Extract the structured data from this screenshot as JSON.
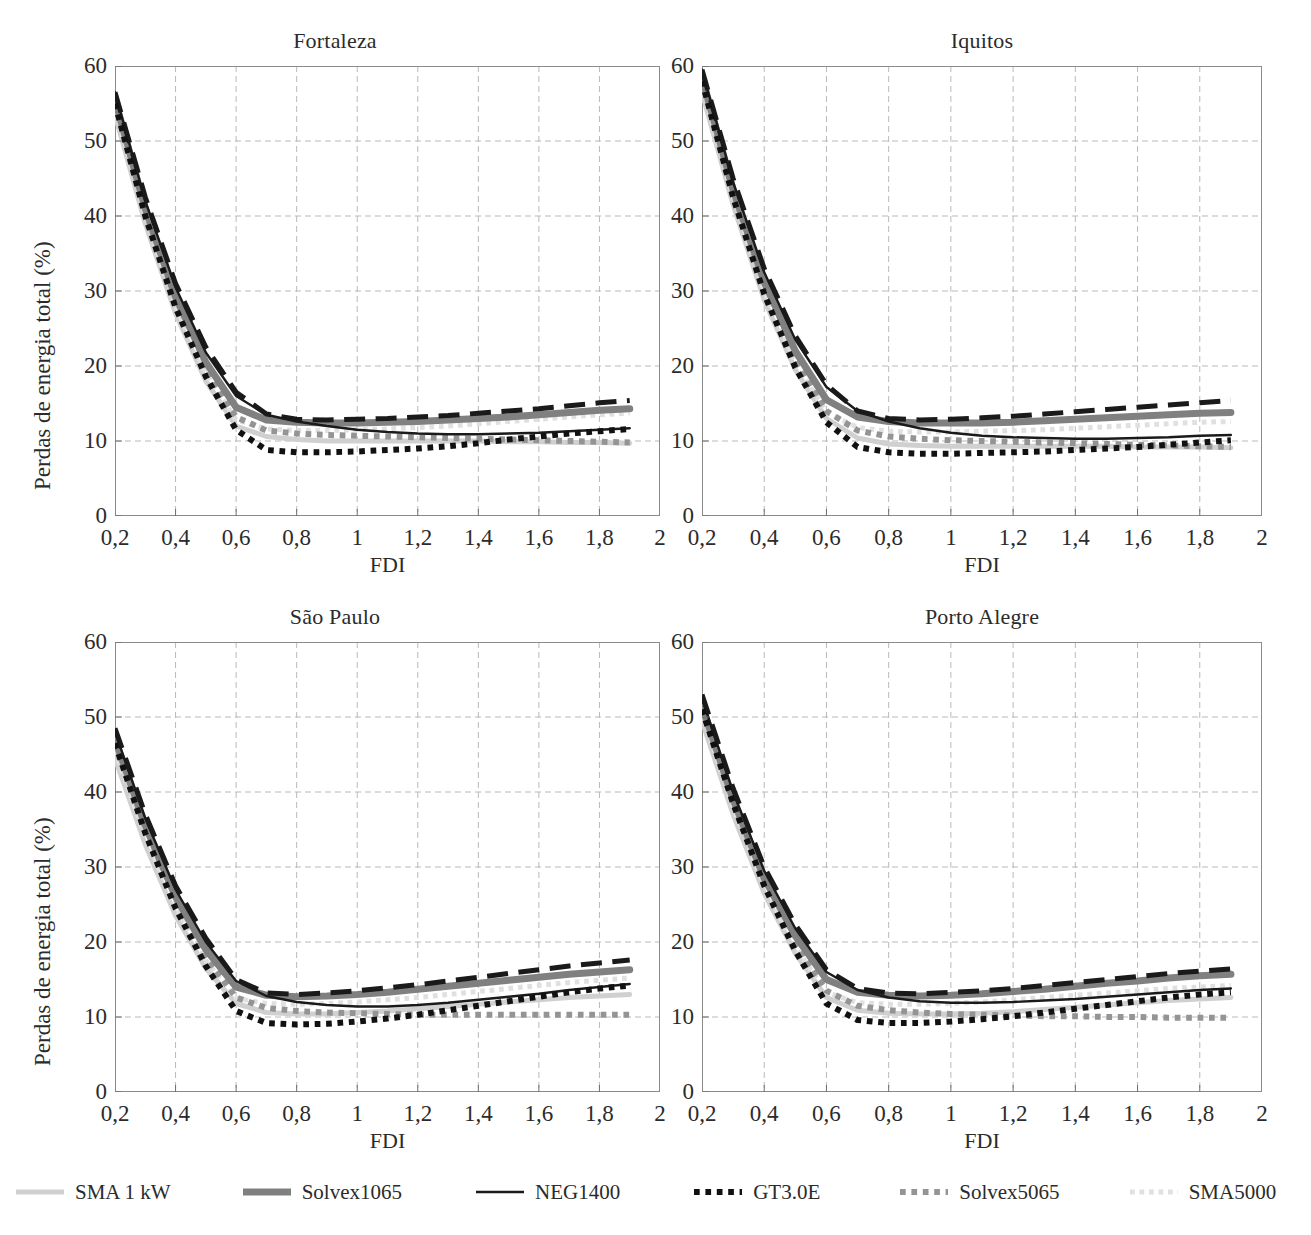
{
  "figure": {
    "ylabel": "Perdas de energia total (%)",
    "xlabel": "FDI",
    "yticks": [
      "0",
      "10",
      "20",
      "30",
      "40",
      "50",
      "60"
    ],
    "xticks": [
      "0,2",
      "0,4",
      "0,6",
      "0,8",
      "1",
      "1,2",
      "1,4",
      "1,6",
      "1,8",
      "2"
    ]
  },
  "legend": {
    "items": [
      {
        "label": "SMA 1 kW",
        "color": "#d0d0d0",
        "width": 5,
        "dash": "none"
      },
      {
        "label": "Solvex1065",
        "color": "#808080",
        "width": 7,
        "dash": "none"
      },
      {
        "label": "NEG1400",
        "color": "#1a1a1a",
        "width": 2.4,
        "dash": "none"
      },
      {
        "label": "GT3.0E",
        "color": "#111111",
        "width": 6,
        "dash": "dot"
      },
      {
        "label": "Solvex5065",
        "color": "#949494",
        "width": 6,
        "dash": "dot"
      },
      {
        "label": "SMA5000",
        "color": "#e0e0e0",
        "width": 5,
        "dash": "dot"
      },
      {
        "label": "PVV3000",
        "color": "#1a1a1a",
        "width": 5,
        "dash": "dash"
      }
    ]
  },
  "chart_data": [
    {
      "type": "line",
      "title": "Fortaleza",
      "xlabel": "FDI",
      "ylabel": "Perdas de energia total (%)",
      "xlim": [
        0.2,
        2.0
      ],
      "ylim": [
        0,
        60
      ],
      "grid": true,
      "legend_position": "bottom",
      "x": [
        0.2,
        0.3,
        0.4,
        0.5,
        0.6,
        0.7,
        0.8,
        0.9,
        1.0,
        1.1,
        1.2,
        1.3,
        1.4,
        1.5,
        1.6,
        1.7,
        1.8,
        1.9
      ],
      "series": [
        {
          "name": "SMA 1 kW",
          "values": [
            53.5,
            39.0,
            27.0,
            18.0,
            12.0,
            10.6,
            10.2,
            10.0,
            10.0,
            10.0,
            10.0,
            10.0,
            10.0,
            9.9,
            9.9,
            9.8,
            9.8,
            9.7
          ]
        },
        {
          "name": "Solvex1065",
          "values": [
            55.5,
            41.0,
            29.2,
            20.5,
            14.5,
            12.8,
            12.5,
            12.4,
            12.4,
            12.5,
            12.6,
            12.8,
            13.0,
            13.2,
            13.5,
            13.8,
            14.1,
            14.3
          ]
        },
        {
          "name": "NEG1400",
          "values": [
            56.5,
            42.0,
            30.5,
            21.8,
            16.0,
            13.5,
            12.6,
            12.0,
            11.5,
            11.2,
            11.0,
            10.9,
            10.9,
            11.0,
            11.1,
            11.3,
            11.5,
            11.7
          ]
        },
        {
          "name": "GT3.0E",
          "values": [
            55.0,
            40.0,
            27.8,
            18.6,
            11.5,
            8.8,
            8.5,
            8.5,
            8.6,
            8.8,
            9.0,
            9.3,
            9.7,
            10.2,
            10.6,
            11.0,
            11.3,
            11.6
          ]
        },
        {
          "name": "Solvex5065",
          "values": [
            55.0,
            40.5,
            28.5,
            19.5,
            13.2,
            11.4,
            11.0,
            10.8,
            10.7,
            10.6,
            10.5,
            10.4,
            10.3,
            10.2,
            10.1,
            10.0,
            9.9,
            9.8
          ]
        },
        {
          "name": "SMA5000",
          "values": [
            54.5,
            40.0,
            28.0,
            19.0,
            12.8,
            11.6,
            11.4,
            11.4,
            11.5,
            11.6,
            11.8,
            12.0,
            12.3,
            12.6,
            12.9,
            13.2,
            13.5,
            13.7
          ]
        },
        {
          "name": "PVV3000",
          "values": [
            56.5,
            42.5,
            31.0,
            22.5,
            16.5,
            13.6,
            12.9,
            12.8,
            12.9,
            13.0,
            13.2,
            13.4,
            13.7,
            14.0,
            14.3,
            14.7,
            15.1,
            15.4
          ]
        }
      ]
    },
    {
      "type": "line",
      "title": "Iquitos",
      "xlabel": "FDI",
      "ylabel": "Perdas de energia total (%)",
      "xlim": [
        0.2,
        2.0
      ],
      "ylim": [
        0,
        60
      ],
      "grid": true,
      "legend_position": "bottom",
      "x": [
        0.2,
        0.3,
        0.4,
        0.5,
        0.6,
        0.7,
        0.8,
        0.9,
        1.0,
        1.1,
        1.2,
        1.3,
        1.4,
        1.5,
        1.6,
        1.7,
        1.8,
        1.9
      ],
      "series": [
        {
          "name": "SMA 1 kW",
          "values": [
            56.5,
            41.5,
            28.8,
            19.5,
            13.0,
            10.4,
            9.6,
            9.4,
            9.3,
            9.3,
            9.3,
            9.3,
            9.3,
            9.3,
            9.2,
            9.2,
            9.2,
            9.1
          ]
        },
        {
          "name": "Solvex1065",
          "values": [
            58.5,
            43.5,
            31.2,
            22.0,
            15.5,
            13.2,
            12.6,
            12.4,
            12.4,
            12.4,
            12.5,
            12.7,
            12.9,
            13.1,
            13.3,
            13.5,
            13.7,
            13.8
          ]
        },
        {
          "name": "NEG1400",
          "values": [
            59.5,
            44.5,
            32.5,
            23.5,
            17.2,
            14.0,
            12.6,
            11.7,
            11.1,
            10.7,
            10.5,
            10.4,
            10.3,
            10.3,
            10.4,
            10.5,
            10.7,
            10.8
          ]
        },
        {
          "name": "GT3.0E",
          "values": [
            58.0,
            42.5,
            29.6,
            19.8,
            12.5,
            9.2,
            8.5,
            8.3,
            8.3,
            8.4,
            8.5,
            8.6,
            8.8,
            9.0,
            9.2,
            9.5,
            9.8,
            10.1
          ]
        },
        {
          "name": "Solvex5065",
          "values": [
            58.0,
            43.0,
            30.5,
            20.8,
            14.0,
            11.4,
            10.6,
            10.3,
            10.1,
            10.0,
            9.9,
            9.8,
            9.7,
            9.6,
            9.5,
            9.4,
            9.3,
            9.2
          ]
        },
        {
          "name": "SMA5000",
          "values": [
            57.5,
            42.5,
            30.0,
            20.5,
            13.8,
            11.8,
            11.3,
            11.2,
            11.2,
            11.3,
            11.4,
            11.5,
            11.7,
            11.9,
            12.1,
            12.3,
            12.5,
            12.6
          ]
        },
        {
          "name": "PVV3000",
          "values": [
            59.5,
            45.0,
            33.0,
            24.0,
            17.5,
            14.0,
            13.0,
            12.8,
            12.9,
            13.1,
            13.3,
            13.6,
            13.9,
            14.2,
            14.5,
            14.8,
            15.1,
            15.4
          ]
        }
      ]
    },
    {
      "type": "line",
      "title": "São Paulo",
      "xlabel": "FDI",
      "ylabel": "Perdas de energia total (%)",
      "xlim": [
        0.2,
        2.0
      ],
      "ylim": [
        0,
        60
      ],
      "grid": true,
      "legend_position": "bottom",
      "x": [
        0.2,
        0.3,
        0.4,
        0.5,
        0.6,
        0.7,
        0.8,
        0.9,
        1.0,
        1.1,
        1.2,
        1.3,
        1.4,
        1.5,
        1.6,
        1.7,
        1.8,
        1.9
      ],
      "series": [
        {
          "name": "SMA 1 kW",
          "values": [
            44.5,
            33.0,
            23.5,
            16.5,
            11.8,
            10.6,
            10.4,
            10.4,
            10.6,
            10.8,
            11.1,
            11.4,
            11.7,
            12.0,
            12.3,
            12.6,
            12.8,
            13.0
          ]
        },
        {
          "name": "Solvex1065",
          "values": [
            47.0,
            35.5,
            26.0,
            19.0,
            14.0,
            12.9,
            12.7,
            12.8,
            13.0,
            13.3,
            13.7,
            14.1,
            14.5,
            14.9,
            15.3,
            15.7,
            16.0,
            16.3
          ]
        },
        {
          "name": "NEG1400",
          "values": [
            48.0,
            36.5,
            27.0,
            20.0,
            14.8,
            12.8,
            12.0,
            11.6,
            11.4,
            11.4,
            11.6,
            11.9,
            12.3,
            12.7,
            13.1,
            13.6,
            14.0,
            14.4
          ]
        },
        {
          "name": "GT3.0E",
          "values": [
            46.5,
            34.5,
            24.5,
            16.8,
            10.8,
            9.2,
            9.0,
            9.1,
            9.4,
            9.8,
            10.3,
            10.9,
            11.5,
            12.1,
            12.7,
            13.3,
            13.8,
            14.2
          ]
        },
        {
          "name": "Solvex5065",
          "values": [
            46.5,
            35.0,
            25.5,
            18.0,
            12.6,
            11.2,
            10.8,
            10.6,
            10.5,
            10.4,
            10.3,
            10.3,
            10.3,
            10.3,
            10.3,
            10.3,
            10.3,
            10.3
          ]
        },
        {
          "name": "SMA5000",
          "values": [
            45.5,
            34.0,
            24.8,
            17.5,
            12.5,
            11.8,
            11.7,
            11.8,
            12.0,
            12.3,
            12.6,
            13.0,
            13.4,
            13.8,
            14.2,
            14.6,
            14.9,
            15.2
          ]
        },
        {
          "name": "PVV3000",
          "values": [
            48.5,
            37.0,
            27.5,
            20.5,
            15.0,
            13.2,
            13.0,
            13.2,
            13.5,
            13.9,
            14.3,
            14.8,
            15.3,
            15.8,
            16.3,
            16.8,
            17.2,
            17.6
          ]
        }
      ]
    },
    {
      "type": "line",
      "title": "Porto Alegre",
      "xlabel": "FDI",
      "ylabel": "Perdas de energia total (%)",
      "xlim": [
        0.2,
        2.0
      ],
      "ylim": [
        0,
        60
      ],
      "grid": true,
      "legend_position": "bottom",
      "x": [
        0.2,
        0.3,
        0.4,
        0.5,
        0.6,
        0.7,
        0.8,
        0.9,
        1.0,
        1.1,
        1.2,
        1.3,
        1.4,
        1.5,
        1.6,
        1.7,
        1.8,
        1.9
      ],
      "series": [
        {
          "name": "SMA 1 kW",
          "values": [
            49.5,
            37.0,
            26.5,
            18.5,
            12.6,
            10.9,
            10.5,
            10.4,
            10.4,
            10.5,
            10.7,
            11.0,
            11.3,
            11.6,
            11.9,
            12.2,
            12.4,
            12.6
          ]
        },
        {
          "name": "Solvex1065",
          "values": [
            51.5,
            39.0,
            28.5,
            20.8,
            15.0,
            13.3,
            12.9,
            12.8,
            12.9,
            13.1,
            13.4,
            13.7,
            14.1,
            14.5,
            14.8,
            15.2,
            15.5,
            15.7
          ]
        },
        {
          "name": "NEG1400",
          "values": [
            52.5,
            40.0,
            29.5,
            21.8,
            16.0,
            13.6,
            12.6,
            12.1,
            11.9,
            11.9,
            12.0,
            12.2,
            12.4,
            12.7,
            13.0,
            13.3,
            13.6,
            13.8
          ]
        },
        {
          "name": "GT3.0E",
          "values": [
            51.0,
            38.5,
            27.5,
            18.8,
            11.8,
            9.6,
            9.2,
            9.2,
            9.4,
            9.7,
            10.1,
            10.6,
            11.1,
            11.6,
            12.1,
            12.6,
            13.0,
            13.3
          ]
        },
        {
          "name": "Solvex5065",
          "values": [
            51.0,
            38.5,
            28.0,
            19.8,
            13.5,
            11.5,
            10.9,
            10.6,
            10.4,
            10.3,
            10.2,
            10.1,
            10.1,
            10.0,
            10.0,
            9.9,
            9.9,
            9.9
          ]
        },
        {
          "name": "SMA5000",
          "values": [
            50.5,
            38.0,
            27.5,
            19.3,
            13.3,
            11.9,
            11.7,
            11.7,
            11.8,
            12.0,
            12.3,
            12.6,
            12.9,
            13.2,
            13.5,
            13.8,
            14.0,
            14.2
          ]
        },
        {
          "name": "PVV3000",
          "values": [
            53.0,
            40.5,
            30.0,
            22.3,
            16.3,
            13.8,
            13.2,
            13.1,
            13.3,
            13.5,
            13.8,
            14.2,
            14.6,
            15.0,
            15.4,
            15.8,
            16.1,
            16.4
          ]
        }
      ]
    }
  ]
}
